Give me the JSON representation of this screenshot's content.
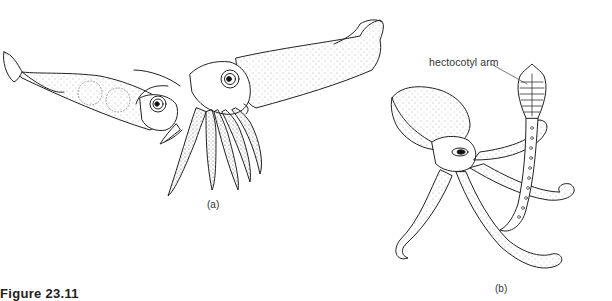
{
  "figure": {
    "caption": "Figure 23.11",
    "panels": [
      {
        "id": "a",
        "label": "(a)",
        "subject": "squid"
      },
      {
        "id": "b",
        "label": "(b)",
        "subject": "octopus"
      }
    ],
    "annotations": [
      {
        "panel": "b",
        "text": "hectocotyl arm"
      }
    ]
  }
}
